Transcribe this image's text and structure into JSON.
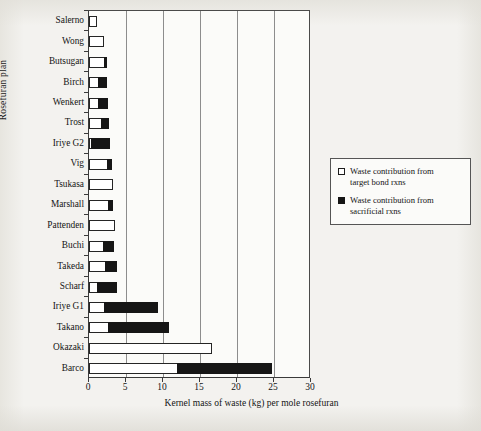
{
  "chart_data": {
    "type": "bar",
    "orientation": "horizontal",
    "stacked": true,
    "title": "",
    "xlabel": "Kernel mass of waste (kg) per mole rosefuran",
    "ylabel": "Rosefuran plan",
    "xlim": [
      0,
      30
    ],
    "xticks": [
      0,
      5,
      10,
      15,
      20,
      25,
      30
    ],
    "xticklabels": [
      "0",
      "5",
      "10",
      "15",
      "20",
      "25",
      "30"
    ],
    "grid": "vertical",
    "legend_position": "right",
    "categories": [
      "Salerno",
      "Wong",
      "Butsugan",
      "Birch",
      "Wenkert",
      "Trost",
      "Iriye G2",
      "Vig",
      "Tsukasa",
      "Marshall",
      "Pattenden",
      "Buchi",
      "Takeda",
      "Scharf",
      "Iriye G1",
      "Takano",
      "Okazaki",
      "Barco"
    ],
    "series": [
      {
        "name": "Waste contribution from target bond rxns",
        "color": "#ffffff",
        "values": [
          1.1,
          2.0,
          2.1,
          1.3,
          1.4,
          1.7,
          0.4,
          2.6,
          3.2,
          2.7,
          3.5,
          2.0,
          2.3,
          1.2,
          2.2,
          2.7,
          16.6,
          12.0
        ]
      },
      {
        "name": "Waste contribution from sacrificial rxns",
        "color": "#161616",
        "values": [
          0.0,
          0.0,
          0.5,
          1.3,
          1.3,
          1.1,
          2.6,
          0.6,
          0.0,
          0.7,
          0.0,
          1.5,
          1.6,
          2.7,
          7.3,
          8.2,
          0.0,
          12.9
        ]
      }
    ],
    "totals": [
      1.1,
      2.0,
      2.6,
      2.6,
      2.7,
      2.8,
      3.0,
      3.2,
      3.2,
      3.4,
      3.5,
      3.5,
      3.9,
      3.9,
      9.5,
      10.9,
      16.6,
      24.9
    ]
  },
  "legend": {
    "items": [
      {
        "marker": "open-square",
        "label_line1": "Waste contribution from",
        "label_line2": "target bond rxns"
      },
      {
        "marker": "filled-square",
        "label_line1": "Waste contribution from",
        "label_line2": "sacrificial rxns"
      }
    ]
  }
}
